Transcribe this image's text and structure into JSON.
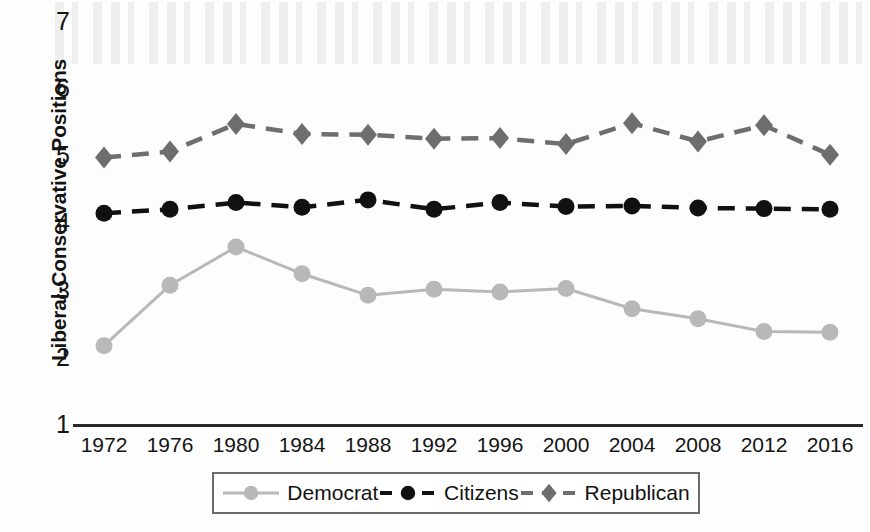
{
  "chart_data": {
    "type": "line",
    "title": "",
    "xlabel": "",
    "ylabel": "Liberal-Conservative Positions",
    "x": [
      1972,
      1976,
      1980,
      1984,
      1988,
      1992,
      1996,
      2000,
      2004,
      2008,
      2012,
      2016
    ],
    "categories": [
      "1972",
      "1976",
      "1980",
      "1984",
      "1988",
      "1992",
      "1996",
      "2000",
      "2004",
      "2008",
      "2012",
      "2016"
    ],
    "ylim": [
      1,
      7
    ],
    "yticks": [
      "1",
      "2",
      "3",
      "4",
      "5",
      "6",
      "7"
    ],
    "grid": false,
    "legend_position": "bottom",
    "series": [
      {
        "name": "Democrat",
        "color": "#b8b8b8",
        "marker": "circle",
        "linestyle": "solid",
        "values": [
          2.18,
          3.08,
          3.65,
          3.25,
          2.93,
          3.02,
          2.98,
          3.03,
          2.73,
          2.58,
          2.39,
          2.38
        ]
      },
      {
        "name": "Citizens",
        "color": "#111111",
        "marker": "circle",
        "linestyle": "dashed",
        "values": [
          4.15,
          4.21,
          4.31,
          4.24,
          4.35,
          4.21,
          4.31,
          4.25,
          4.26,
          4.23,
          4.22,
          4.21
        ]
      },
      {
        "name": "Republican",
        "color": "#6e6e6e",
        "marker": "diamond",
        "linestyle": "dashed",
        "values": [
          4.98,
          5.07,
          5.48,
          5.33,
          5.32,
          5.26,
          5.27,
          5.18,
          5.49,
          5.22,
          5.46,
          5.02
        ]
      }
    ]
  },
  "legend": {
    "items": [
      {
        "label": "Democrat"
      },
      {
        "label": "Citizens"
      },
      {
        "label": "Republican"
      }
    ]
  }
}
